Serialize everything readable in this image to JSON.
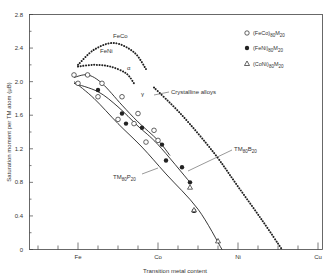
{
  "chart_data": {
    "type": "line",
    "title": "",
    "xlabel": "Transition metal content",
    "ylabel": "Saturation moment per TM atom (μB)",
    "ylim": [
      0,
      2.8
    ],
    "yticks": [
      "0",
      "0.4",
      "0.8",
      "1.2",
      "1.6",
      "2.0",
      "2.4",
      "2.8"
    ],
    "ytick_values": [
      0,
      0.4,
      0.8,
      1.2,
      1.6,
      2.0,
      2.4,
      2.8
    ],
    "xticks": [
      "Fe",
      "Co",
      "Ni",
      "Cu"
    ],
    "x_positions": {
      "Fe": 0,
      "Co": 1,
      "Ni": 2,
      "Cu": 3
    },
    "grid": false,
    "legend_position": "top-right",
    "legend": [
      {
        "symbol": "open-circle",
        "label": "(FeCo)80M20"
      },
      {
        "symbol": "filled-circle",
        "label": "(FeNi)80M20"
      },
      {
        "symbol": "open-triangle",
        "label": "(CoNi)80M20"
      }
    ],
    "annotations": [
      {
        "text": "FeCo",
        "target": "crystalline FeCo curve"
      },
      {
        "text": "FeNi",
        "target": "crystalline FeNi curve"
      },
      {
        "text": "α",
        "target": "alpha phase crystalline"
      },
      {
        "text": "γ",
        "target": "gamma phase crystalline"
      },
      {
        "text": "Crystalline alloys",
        "target": "dotted curves"
      },
      {
        "text": "TM80B20",
        "target": "upper solid line"
      },
      {
        "text": "TM80P20",
        "target": "lower solid line"
      }
    ],
    "series": [
      {
        "name": "Crystalline FeCo (α)",
        "style": "dotted",
        "x": [
          0.0,
          0.2,
          0.45,
          0.7,
          0.85
        ],
        "y": [
          2.2,
          2.38,
          2.46,
          2.35,
          2.15
        ]
      },
      {
        "name": "Crystalline FeNi (α)",
        "style": "dotted",
        "x": [
          0.0,
          0.2,
          0.4,
          0.6,
          0.7
        ],
        "y": [
          2.18,
          2.2,
          2.18,
          2.1,
          1.98
        ]
      },
      {
        "name": "Crystalline γ alloys",
        "style": "dotted",
        "x": [
          0.95,
          1.3,
          1.7,
          2.0,
          2.3,
          2.55
        ],
        "y": [
          1.93,
          1.6,
          1.15,
          0.75,
          0.35,
          0.0
        ]
      },
      {
        "name": "TM80B20 (FeCo)",
        "style": "solid",
        "x": [
          -0.05,
          0.12,
          0.3,
          0.55,
          0.75,
          1.0,
          1.15
        ],
        "y": [
          2.05,
          2.08,
          1.98,
          1.72,
          1.52,
          1.3,
          1.12
        ]
      },
      {
        "name": "TM80B20 (FeNi)",
        "style": "solid",
        "x": [
          -0.05,
          0.25,
          0.5,
          0.75,
          1.0,
          1.4
        ],
        "y": [
          1.98,
          1.88,
          1.7,
          1.47,
          1.25,
          0.8
        ]
      },
      {
        "name": "TM80P20",
        "style": "solid",
        "x": [
          -0.05,
          0.2,
          0.5,
          0.8,
          1.1,
          1.5,
          1.8
        ],
        "y": [
          2.0,
          1.8,
          1.5,
          1.22,
          0.9,
          0.48,
          0.0
        ]
      },
      {
        "name": "(FeCo)80M20 points",
        "style": "marker-open-circle",
        "x": [
          -0.05,
          0.12,
          0.3,
          0.55,
          0.7,
          0.75,
          0.95,
          1.0,
          0.0,
          0.25,
          0.5,
          0.85
        ],
        "y": [
          2.08,
          2.08,
          1.98,
          1.82,
          1.5,
          1.62,
          1.42,
          1.3,
          1.98,
          1.82,
          1.55,
          1.28
        ]
      },
      {
        "name": "(FeNi)80M20 points",
        "style": "marker-filled-circle",
        "x": [
          0.25,
          0.55,
          0.8,
          1.05,
          1.3,
          1.4,
          0.6,
          1.1,
          1.45
        ],
        "y": [
          1.9,
          1.62,
          1.45,
          1.25,
          0.98,
          0.8,
          1.5,
          1.06,
          0.46
        ]
      },
      {
        "name": "(CoNi)80M20 points",
        "style": "marker-open-triangle",
        "x": [
          1.4,
          1.45,
          1.75
        ],
        "y": [
          0.74,
          0.47,
          0.1
        ]
      }
    ]
  }
}
